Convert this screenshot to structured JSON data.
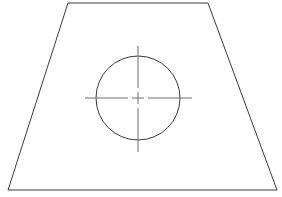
{
  "document": {
    "title": "Technical Line Drawing",
    "description": "Trapezoidal outline with inscribed circle and center mark",
    "background_color": "#ffffff",
    "width": 282,
    "height": 197
  },
  "style": {
    "outline_color": "#3a3a3e",
    "circle_color": "#3a3a3e",
    "centerline_color": "#6e6e73",
    "outline_width": 1,
    "circle_width": 1,
    "centerline_width": 1
  },
  "shapes": {
    "outline": {
      "name": "trapezoid",
      "type": "polygon",
      "closed": true,
      "points": "68,3 208,3 277,190 8,190",
      "vertices": [
        {
          "label": "top-left",
          "x": 68,
          "y": 3
        },
        {
          "label": "top-right",
          "x": 208,
          "y": 3
        },
        {
          "label": "bottom-right",
          "x": 277,
          "y": 190
        },
        {
          "label": "bottom-left",
          "x": 8,
          "y": 190
        }
      ]
    },
    "circle": {
      "name": "inscribed-circle",
      "type": "circle",
      "cx": 138,
      "cy": 98,
      "r": 42,
      "diameter": 84
    },
    "center_mark": {
      "name": "center-mark",
      "type": "centerlines",
      "cx": 138,
      "cy": 98,
      "cross_half_length": 6,
      "gap": 4,
      "horizontal_left_end": 85,
      "horizontal_right_end": 192,
      "vertical_top_end": 46,
      "vertical_bottom_end": 152,
      "segments": {
        "cross_horizontal": "M 132 98 L 144 98",
        "cross_vertical": "M 138 92 L 138 104",
        "left_arm": "M 85 98 L 128 98",
        "right_arm": "M 148 98 L 192 98",
        "top_arm": "M 138 46 L 138 88",
        "bottom_arm": "M 138 108 L 138 152"
      }
    }
  }
}
